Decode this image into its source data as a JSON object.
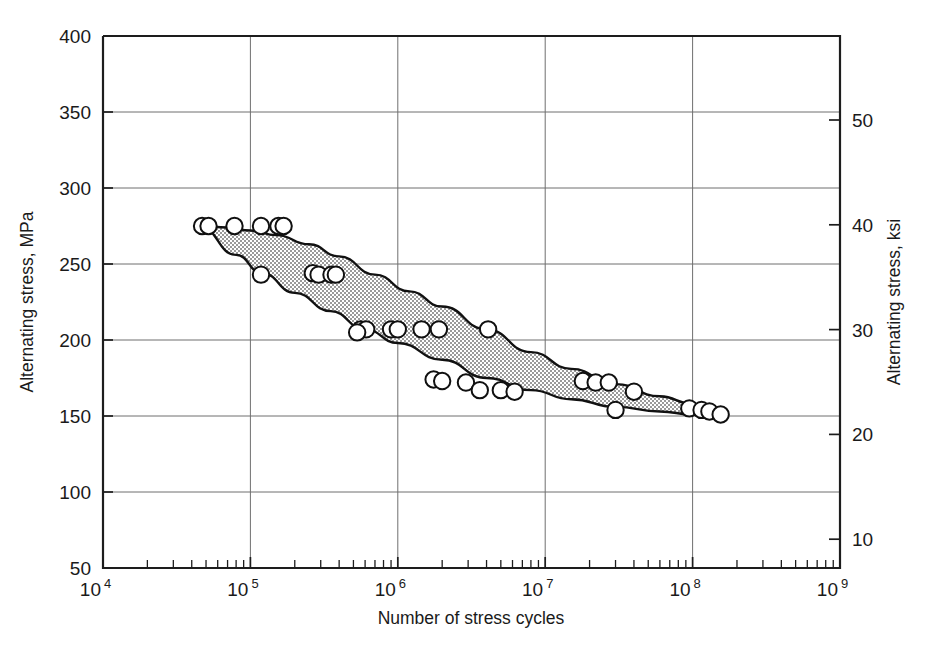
{
  "chart_data": {
    "type": "scatter",
    "title": "",
    "xlabel": "Number of stress cycles",
    "ylabel": "Alternating stress, MPa",
    "ylabel_right": "Alternating stress, ksi",
    "xscale": "log",
    "yscale": "linear",
    "xlim": [
      10000,
      1000000000
    ],
    "ylim": [
      50,
      400
    ],
    "ylim_right": [
      7.252,
      58.015
    ],
    "grid": true,
    "legend": null,
    "x_tick_labels": [
      "10",
      "10",
      "10",
      "10",
      "10",
      "10"
    ],
    "x_tick_exponents": [
      "4",
      "5",
      "6",
      "7",
      "8",
      "9"
    ],
    "x_tick_values": [
      10000,
      100000,
      1000000,
      10000000,
      100000000,
      1000000000
    ],
    "x_minor_multipliers": [
      2,
      3,
      4,
      5,
      6,
      7,
      8,
      9
    ],
    "y_tick_labels": [
      "50",
      "100",
      "150",
      "200",
      "250",
      "300",
      "350",
      "400"
    ],
    "y_tick_values": [
      50,
      100,
      150,
      200,
      250,
      300,
      350,
      400
    ],
    "y_gridline_values": [
      100,
      150,
      200,
      250,
      300,
      350
    ],
    "y_right_tick_labels": [
      "10",
      "20",
      "30",
      "40",
      "50"
    ],
    "y_right_tick_values": [
      10,
      20,
      30,
      40,
      50
    ],
    "ksi_per_mpa": 0.1450377,
    "band": {
      "name": "Scatter band of fatigue data",
      "fill": "#b4b4b4",
      "pattern": "stipple",
      "upper_bound": [
        [
          45000,
          275
        ],
        [
          70000,
          274
        ],
        [
          100000,
          272
        ],
        [
          150000,
          269
        ],
        [
          250000,
          263
        ],
        [
          400000,
          255
        ],
        [
          700000,
          243
        ],
        [
          1200000,
          232
        ],
        [
          2000000,
          222
        ],
        [
          4000000,
          207
        ],
        [
          8000000,
          192
        ],
        [
          15000000,
          181
        ],
        [
          30000000,
          171
        ],
        [
          60000000,
          163
        ],
        [
          100000000,
          158
        ],
        [
          160000000,
          152
        ]
      ],
      "lower_bound": [
        [
          45000,
          275
        ],
        [
          80000,
          256
        ],
        [
          120000,
          244
        ],
        [
          200000,
          231
        ],
        [
          350000,
          219
        ],
        [
          600000,
          207
        ],
        [
          1000000,
          198
        ],
        [
          2000000,
          187
        ],
        [
          4000000,
          175
        ],
        [
          8000000,
          167
        ],
        [
          15000000,
          161
        ],
        [
          30000000,
          156
        ],
        [
          60000000,
          153
        ],
        [
          100000000,
          151
        ],
        [
          160000000,
          150
        ]
      ]
    },
    "series": [
      {
        "name": "Fatigue test data (upper bound)",
        "marker": "open-circle",
        "points": [
          [
            47000,
            275
          ],
          [
            52000,
            275
          ],
          [
            78000,
            275
          ],
          [
            118000,
            275
          ],
          [
            155000,
            275
          ],
          [
            168000,
            275
          ],
          [
            265000,
            244
          ],
          [
            290000,
            243
          ],
          [
            355000,
            243
          ],
          [
            380000,
            243
          ],
          [
            560000,
            207
          ],
          [
            610000,
            207
          ],
          [
            900000,
            207
          ],
          [
            1000000,
            207
          ],
          [
            1450000,
            207
          ],
          [
            1900000,
            207
          ],
          [
            1750000,
            174
          ],
          [
            2000000,
            173
          ],
          [
            2900000,
            172
          ]
        ]
      },
      {
        "name": "Fatigue test data (lower bound)",
        "marker": "open-circle",
        "points": [
          [
            118000,
            243
          ],
          [
            530000,
            205
          ],
          [
            3600000,
            167
          ],
          [
            5000000,
            167
          ],
          [
            6200000,
            166
          ],
          [
            18000000,
            173
          ],
          [
            22000000,
            172
          ],
          [
            27000000,
            172
          ],
          [
            30000000,
            154
          ],
          [
            40000000,
            166
          ],
          [
            95000000,
            155
          ],
          [
            115000000,
            154
          ],
          [
            130000000,
            153
          ],
          [
            155000000,
            151
          ]
        ]
      },
      {
        "name": "Outlier above band",
        "marker": "open-circle",
        "points": [
          [
            4100000,
            207
          ]
        ]
      }
    ]
  },
  "figure": {
    "background": "#ffffff",
    "axis_color": "#1d1d1d",
    "grid_color": "#6f6f6f",
    "marker_edge_color": "#101010",
    "marker_fill_color": "#ffffff"
  }
}
